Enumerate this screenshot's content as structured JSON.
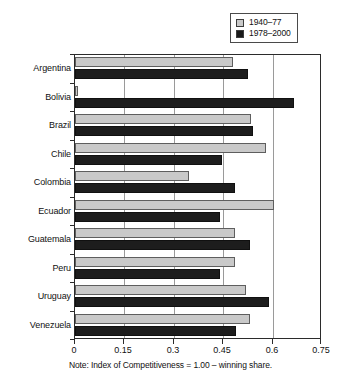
{
  "chart_data": {
    "type": "bar",
    "orientation": "horizontal",
    "title": "",
    "subtitle": "",
    "xlabel": "",
    "ylabel": "",
    "xlim": [
      0,
      0.75
    ],
    "xticks": [
      "0",
      "0.15",
      "0.3",
      "0.45",
      "0.6",
      "0.75"
    ],
    "xtick_values": [
      0,
      0.15,
      0.3,
      0.45,
      0.6,
      0.75
    ],
    "grid": "vertical",
    "legend_position": "top-right",
    "categories": [
      "Argentina",
      "Bolivia",
      "Brazil",
      "Chile",
      "Colombia",
      "Ecuador",
      "Guatemala",
      "Peru",
      "Uruguay",
      "Venezuela"
    ],
    "series": [
      {
        "name": "1940–77",
        "color": "#c9c9c9",
        "values": [
          0.48,
          0.01,
          0.535,
          0.58,
          0.345,
          0.605,
          0.485,
          0.485,
          0.52,
          0.53
        ]
      },
      {
        "name": "1978–2000",
        "color": "#1d1d1d",
        "values": [
          0.525,
          0.665,
          0.54,
          0.445,
          0.485,
          0.44,
          0.53,
          0.44,
          0.59,
          0.49
        ]
      }
    ],
    "note": "Note: Index of Competitiveness = 1.00 – winning share."
  },
  "legend": {
    "items": [
      {
        "label": "1940–77",
        "swatch": "legend-swatch-gray"
      },
      {
        "label": "1978–2000",
        "swatch": "legend-swatch-black"
      }
    ]
  }
}
